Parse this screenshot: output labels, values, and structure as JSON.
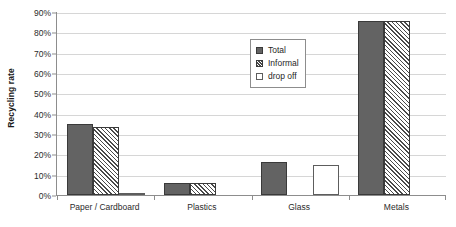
{
  "chart_data": {
    "type": "bar",
    "title": "",
    "subtitle": "",
    "xlabel": "",
    "ylabel": "Recycling rate",
    "ylim": [
      0,
      90
    ],
    "ytick_labels": [
      "0%",
      "10%",
      "20%",
      "30%",
      "40%",
      "50%",
      "60%",
      "70%",
      "80%",
      "90%"
    ],
    "ytick_values": [
      0,
      10,
      20,
      30,
      40,
      50,
      60,
      70,
      80,
      90
    ],
    "grid": true,
    "legend_position": "inside-upper-center",
    "categories": [
      "Paper / Cardboard",
      "Plastics",
      "Glass",
      "Metals"
    ],
    "series": [
      {
        "name": "Total",
        "style": "solid-dark-gray",
        "color": "#636363",
        "values": [
          35,
          6,
          16,
          85.5
        ]
      },
      {
        "name": "Informal",
        "style": "diagonal-hatch",
        "color": "#4a4a4a",
        "values": [
          33.5,
          6,
          0,
          85.5
        ]
      },
      {
        "name": "drop off",
        "style": "white-empty",
        "color": "#ffffff",
        "values": [
          1,
          0,
          15,
          0
        ]
      }
    ]
  },
  "axis": {
    "line_color": "#8d8d8d",
    "grid_color": "#d6d6d6"
  }
}
